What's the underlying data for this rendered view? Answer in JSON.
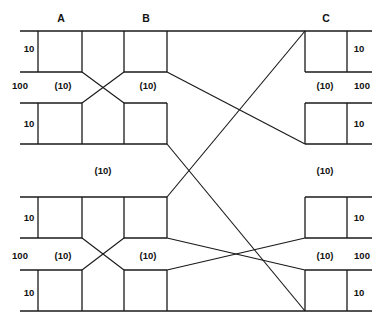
{
  "figure": {
    "kind": "three-stage-clos-switching-network",
    "background_color": "#ffffff",
    "line_color": "#1a1a1a",
    "text_color": "#111111",
    "width": 382,
    "height": 328
  },
  "stage_labels": [
    {
      "id": "A",
      "text": "A",
      "x": 61,
      "y": 22
    },
    {
      "id": "B",
      "text": "B",
      "x": 146,
      "y": 22
    },
    {
      "id": "C",
      "text": "C",
      "x": 326,
      "y": 22
    }
  ],
  "trunk_labels": [
    {
      "id": "trunk-left-top",
      "text": "100",
      "x": 20,
      "y": 89,
      "side": "left"
    },
    {
      "id": "trunk-right-top",
      "text": "100",
      "x": 362,
      "y": 89,
      "side": "right"
    },
    {
      "id": "trunk-left-bottom",
      "text": "100",
      "x": 20,
      "y": 259,
      "side": "left"
    },
    {
      "id": "trunk-right-bottom",
      "text": "100",
      "x": 362,
      "y": 259,
      "side": "right"
    }
  ],
  "edge_labels": [
    {
      "id": "edge-l1",
      "text": "10",
      "x": 29,
      "y": 52,
      "side": "left"
    },
    {
      "id": "edge-r1",
      "text": "10",
      "x": 359,
      "y": 52,
      "side": "right"
    },
    {
      "id": "edge-l2",
      "text": "10",
      "x": 29,
      "y": 127,
      "side": "left"
    },
    {
      "id": "edge-r2",
      "text": "10",
      "x": 359,
      "y": 127,
      "side": "right"
    },
    {
      "id": "edge-l3",
      "text": "10",
      "x": 29,
      "y": 221,
      "side": "left"
    },
    {
      "id": "edge-r3",
      "text": "10",
      "x": 359,
      "y": 221,
      "side": "right"
    },
    {
      "id": "edge-l4",
      "text": "10",
      "x": 29,
      "y": 296,
      "side": "left"
    },
    {
      "id": "edge-r4",
      "text": "10",
      "x": 359,
      "y": 296,
      "side": "right"
    }
  ],
  "link_labels": [
    {
      "id": "link-a-top",
      "text": "(10)",
      "x": 63,
      "y": 89
    },
    {
      "id": "link-b-top",
      "text": "(10)",
      "x": 148,
      "y": 89
    },
    {
      "id": "link-c-top",
      "text": "(10)",
      "x": 325,
      "y": 89
    },
    {
      "id": "link-mid-left",
      "text": "(10)",
      "x": 103,
      "y": 174
    },
    {
      "id": "link-mid-right",
      "text": "(10)",
      "x": 325,
      "y": 174
    },
    {
      "id": "link-a-bottom",
      "text": "(10)",
      "x": 63,
      "y": 259
    },
    {
      "id": "link-b-bottom",
      "text": "(10)",
      "x": 148,
      "y": 259
    },
    {
      "id": "link-c-bottom",
      "text": "(10)",
      "x": 325,
      "y": 259
    }
  ],
  "geometry": {
    "rails": [
      {
        "id": "rail-r1-top",
        "y": 31,
        "segments": [
          [
            20,
            167
          ],
          [
            167,
            305
          ],
          [
            305,
            372
          ]
        ]
      },
      {
        "id": "rail-r1-bottom",
        "y": 72,
        "segments": [
          [
            20,
            82
          ],
          [
            124,
            167
          ],
          [
            305,
            372
          ]
        ]
      },
      {
        "id": "rail-r2-top",
        "y": 103,
        "segments": [
          [
            20,
            82
          ],
          [
            124,
            167
          ],
          [
            305,
            372
          ]
        ]
      },
      {
        "id": "rail-r2-bottom",
        "y": 144,
        "segments": [
          [
            20,
            167
          ],
          [
            305,
            372
          ]
        ]
      },
      {
        "id": "rail-r3-top",
        "y": 197,
        "segments": [
          [
            20,
            167
          ],
          [
            305,
            372
          ]
        ]
      },
      {
        "id": "rail-r3-bottom",
        "y": 238,
        "segments": [
          [
            20,
            82
          ],
          [
            124,
            167
          ],
          [
            305,
            372
          ]
        ]
      },
      {
        "id": "rail-r4-top",
        "y": 270,
        "segments": [
          [
            20,
            82
          ],
          [
            124,
            167
          ],
          [
            305,
            372
          ]
        ]
      },
      {
        "id": "rail-r4-bottom",
        "y": 311,
        "segments": [
          [
            20,
            305
          ],
          [
            305,
            372
          ]
        ]
      }
    ],
    "vbars": [
      {
        "id": "v-r1-a-in",
        "x": 38,
        "y1": 31,
        "y2": 72
      },
      {
        "id": "v-r1-a-out",
        "x": 82,
        "y1": 31,
        "y2": 72
      },
      {
        "id": "v-r1-b-in",
        "x": 124,
        "y1": 31,
        "y2": 72
      },
      {
        "id": "v-r1-b-out",
        "x": 167,
        "y1": 31,
        "y2": 72
      },
      {
        "id": "v-r1-c-in",
        "x": 305,
        "y1": 31,
        "y2": 72
      },
      {
        "id": "v-r1-c-out",
        "x": 347,
        "y1": 31,
        "y2": 72
      },
      {
        "id": "v-r2-a-in",
        "x": 38,
        "y1": 103,
        "y2": 144
      },
      {
        "id": "v-r2-a-out",
        "x": 82,
        "y1": 103,
        "y2": 144
      },
      {
        "id": "v-r2-b-in",
        "x": 124,
        "y1": 103,
        "y2": 144
      },
      {
        "id": "v-r2-b-out",
        "x": 167,
        "y1": 103,
        "y2": 144
      },
      {
        "id": "v-r2-c-in",
        "x": 305,
        "y1": 103,
        "y2": 144
      },
      {
        "id": "v-r2-c-out",
        "x": 347,
        "y1": 103,
        "y2": 144
      },
      {
        "id": "v-r3-a-in",
        "x": 38,
        "y1": 197,
        "y2": 238
      },
      {
        "id": "v-r3-a-out",
        "x": 82,
        "y1": 197,
        "y2": 238
      },
      {
        "id": "v-r3-b-in",
        "x": 124,
        "y1": 197,
        "y2": 238
      },
      {
        "id": "v-r3-b-out",
        "x": 167,
        "y1": 197,
        "y2": 238
      },
      {
        "id": "v-r3-c-in",
        "x": 305,
        "y1": 197,
        "y2": 238
      },
      {
        "id": "v-r3-c-out",
        "x": 347,
        "y1": 197,
        "y2": 238
      },
      {
        "id": "v-r4-a-in",
        "x": 38,
        "y1": 270,
        "y2": 311
      },
      {
        "id": "v-r4-a-out",
        "x": 82,
        "y1": 270,
        "y2": 311
      },
      {
        "id": "v-r4-b-in",
        "x": 124,
        "y1": 270,
        "y2": 311
      },
      {
        "id": "v-r4-b-out",
        "x": 167,
        "y1": 270,
        "y2": 311
      },
      {
        "id": "v-r4-c-in",
        "x": 305,
        "y1": 270,
        "y2": 311
      },
      {
        "id": "v-r4-c-out",
        "x": 347,
        "y1": 270,
        "y2": 311
      }
    ],
    "diagonals": [
      {
        "id": "ab-cross-top-1",
        "x1": 82,
        "y1": 72,
        "x2": 124,
        "y2": 103
      },
      {
        "id": "ab-cross-top-2",
        "x1": 82,
        "y1": 103,
        "x2": 124,
        "y2": 72
      },
      {
        "id": "ab-cross-bottom-1",
        "x1": 82,
        "y1": 238,
        "x2": 124,
        "y2": 270
      },
      {
        "id": "ab-cross-bottom-2",
        "x1": 82,
        "y1": 270,
        "x2": 124,
        "y2": 238
      },
      {
        "id": "bc-long-1",
        "x1": 167,
        "y1": 72,
        "x2": 305,
        "y2": 144
      },
      {
        "id": "bc-long-2",
        "x1": 167,
        "y1": 144,
        "x2": 305,
        "y2": 311
      },
      {
        "id": "bc-long-3",
        "x1": 167,
        "y1": 197,
        "x2": 305,
        "y2": 31
      },
      {
        "id": "bc-long-4",
        "x1": 167,
        "y1": 238,
        "x2": 305,
        "y2": 270
      },
      {
        "id": "bc-long-5",
        "x1": 167,
        "y1": 270,
        "x2": 305,
        "y2": 238
      }
    ]
  }
}
